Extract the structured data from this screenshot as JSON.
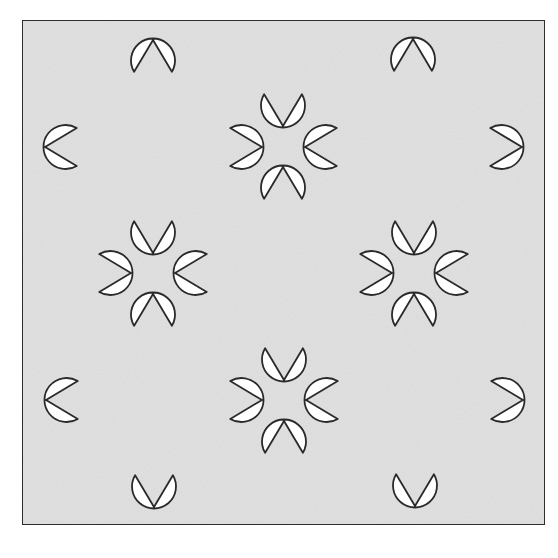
{
  "figure": {
    "width": 558,
    "height": 558,
    "frame": {
      "x": 22,
      "y": 20,
      "width": 523,
      "height": 505
    },
    "colors": {
      "page_background": "#ffffff",
      "panel_fill": "#e3e3e3",
      "frame_stroke": "#333333",
      "drop_fill": "#ffffff",
      "drop_stroke": "#2a2a2a"
    },
    "drop": {
      "radius": 22,
      "tip_distance": 43
    },
    "drops": [
      {
        "cx": 153,
        "cy": 83,
        "tip": "up"
      },
      {
        "cx": 283,
        "cy": 83,
        "tip": "down"
      },
      {
        "cx": 413,
        "cy": 82,
        "tip": "up"
      },
      {
        "cx": 88,
        "cy": 147,
        "tip": "left"
      },
      {
        "cx": 219,
        "cy": 147,
        "tip": "right"
      },
      {
        "cx": 348,
        "cy": 147,
        "tip": "left"
      },
      {
        "cx": 479,
        "cy": 147,
        "tip": "right"
      },
      {
        "cx": 153,
        "cy": 210,
        "tip": "down"
      },
      {
        "cx": 283,
        "cy": 210,
        "tip": "up"
      },
      {
        "cx": 414,
        "cy": 210,
        "tip": "down"
      },
      {
        "cx": 88,
        "cy": 273,
        "tip": "right"
      },
      {
        "cx": 218,
        "cy": 273,
        "tip": "left"
      },
      {
        "cx": 349,
        "cy": 273,
        "tip": "right"
      },
      {
        "cx": 479,
        "cy": 273,
        "tip": "left"
      },
      {
        "cx": 153,
        "cy": 337,
        "tip": "up"
      },
      {
        "cx": 284,
        "cy": 337,
        "tip": "down"
      },
      {
        "cx": 414,
        "cy": 337,
        "tip": "up"
      },
      {
        "cx": 89,
        "cy": 400,
        "tip": "left"
      },
      {
        "cx": 219,
        "cy": 400,
        "tip": "right"
      },
      {
        "cx": 349,
        "cy": 400,
        "tip": "left"
      },
      {
        "cx": 480,
        "cy": 400,
        "tip": "right"
      },
      {
        "cx": 154,
        "cy": 464,
        "tip": "down"
      },
      {
        "cx": 284,
        "cy": 464,
        "tip": "up"
      },
      {
        "cx": 415,
        "cy": 463,
        "tip": "down"
      }
    ]
  }
}
